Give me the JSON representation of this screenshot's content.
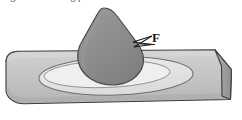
{
  "figure": {
    "clipped_caption": "Fig. 3.10  Welding process",
    "alt_description": "Cylindrical bar with molten droplet and heat affected zone",
    "width": 242,
    "height": 120,
    "background_color": "#ffffff"
  },
  "annotations": {
    "force_label": "F",
    "force_label_name": "force-vector-label"
  },
  "colors": {
    "droplet_fill": "#8a8a8a",
    "droplet_stroke": "#4a4a4a",
    "cylinder_body_fill": "#c2c2c2",
    "cylinder_top_fill": "#cbcbcb",
    "cylinder_end_fill": "#9f9f9f",
    "cylinder_stroke": "#3d3d3d",
    "haz_ellipse_fill": "#e4e4e4",
    "haz_ellipse_stroke": "#6e6e6e",
    "inner_ellipse_fill": "#efefef",
    "arrow_stroke": "#1a1a1a",
    "caption_text": "#5a5a5a"
  },
  "shapes": {
    "cylinder_name": "cylindrical-workpiece",
    "droplet_name": "molten-droplet",
    "haz_name": "heat-affected-zone-ellipse",
    "inner_pool_name": "weld-pool-ellipse",
    "end_face_name": "cylinder-end-face",
    "arrow_name": "force-arrow"
  }
}
